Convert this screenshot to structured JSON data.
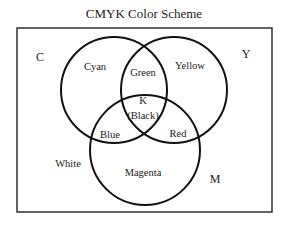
{
  "title": "CMYK Color Scheme",
  "sets": {
    "C": "C",
    "Y": "Y",
    "M": "M"
  },
  "regions": {
    "cyan": "Cyan",
    "yellow": "Yellow",
    "green": "Green",
    "black_k": "K",
    "black_name": "(Black)",
    "blue": "Blue",
    "red": "Red",
    "magenta": "Magenta",
    "white": "White"
  },
  "colors": {
    "stroke": "#111111",
    "background": "#ffffff"
  }
}
